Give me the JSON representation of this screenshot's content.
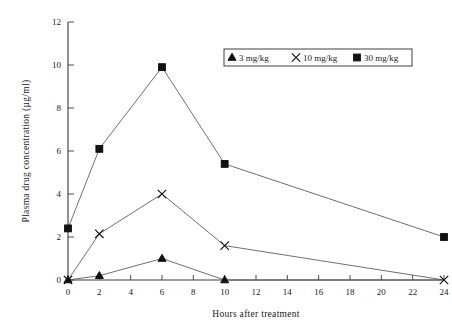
{
  "chart_data": {
    "type": "line",
    "title": "",
    "xlabel": "Hours after treatment",
    "ylabel": "Plasma drug concentration (µg/ml)",
    "x": [
      0,
      2,
      6,
      10,
      24
    ],
    "xlim": [
      0,
      24
    ],
    "ylim": [
      0,
      12
    ],
    "xticks": [
      0,
      2,
      4,
      6,
      8,
      10,
      12,
      14,
      16,
      18,
      20,
      22,
      24
    ],
    "yticks": [
      0,
      2,
      4,
      6,
      8,
      10,
      12
    ],
    "xtick_labels": [
      "0",
      "2",
      "4",
      "6",
      "8",
      "10",
      "12",
      "14",
      "16",
      "18",
      "20",
      "22",
      "24"
    ],
    "ytick_labels": [
      "0",
      "2",
      "4",
      "6",
      "8",
      "10",
      "12"
    ],
    "grid": false,
    "legend_position": "top-right",
    "series": [
      {
        "name": "3 mg/kg",
        "marker": "triangle",
        "values": [
          0,
          0.2,
          1.0,
          0,
          0
        ]
      },
      {
        "name": "10 mg/kg",
        "marker": "cross",
        "values": [
          0,
          2.15,
          4.0,
          1.6,
          0
        ]
      },
      {
        "name": "30 mg/kg",
        "marker": "square",
        "values": [
          2.4,
          6.1,
          9.9,
          5.4,
          2.0
        ]
      }
    ]
  },
  "legend": {
    "entries": [
      {
        "label": "3 mg/kg",
        "marker": "triangle-marker-icon"
      },
      {
        "label": "10 mg/kg",
        "marker": "cross-marker-icon"
      },
      {
        "label": "30 mg/kg",
        "marker": "square-marker-icon"
      }
    ]
  },
  "colors": {
    "axis": "#3a3a3a",
    "line": "#555555",
    "marker": "#111111",
    "background": "#ffffff"
  }
}
